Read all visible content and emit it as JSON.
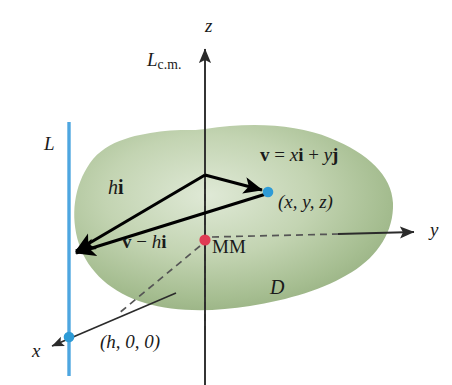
{
  "figure": {
    "background": "#ffffff",
    "width": 452,
    "height": 385
  },
  "colors": {
    "region_fill_light": "#d8e4cd",
    "region_fill_mid": "#a8bf94",
    "region_fill_edge": "#8aa877",
    "axis": "#2b2b2b",
    "vector": "#000000",
    "line_L": "#4ea6e0",
    "point_xyz": "#2e9bd6",
    "point_h00": "#2e9bd6",
    "point_cm": "#e03c54",
    "dashed": "#4a4a4a",
    "text": "#1a1a1a"
  },
  "labels": {
    "z_axis": "z",
    "y_axis": "y",
    "x_axis": "x",
    "line_cm": "L",
    "line_cm_subscript": "c.m.",
    "line_L": "L",
    "vector_hi_h": "h",
    "vector_hi_i": "i",
    "vector_v_minus_hi_v": "v",
    "vector_v_minus_hi_minus": "−",
    "vector_v_minus_hi_h": "h",
    "vector_v_minus_hi_i": "i",
    "vector_eq_v": "v",
    "vector_eq_equals": "=",
    "vector_eq_x": "x",
    "vector_eq_i": "i",
    "vector_eq_plus": "+",
    "vector_eq_y": "y",
    "vector_eq_j": "j",
    "point_xyz": "(x, y, z)",
    "center_of_mass": "MM",
    "region": "D",
    "point_h00": "(h, 0, 0)"
  },
  "geometry": {
    "line_L_x": 69,
    "line_L_top": 122,
    "line_L_bottom": 376,
    "z_axis_x": 205,
    "z_axis_top": 45,
    "z_axis_bottom": 385,
    "origin": {
      "x": 205,
      "y": 240
    },
    "point_xyz": {
      "x": 268,
      "y": 192
    },
    "point_h00": {
      "x": 69,
      "y": 337
    },
    "triangle_apex": {
      "x": 205,
      "y": 175
    },
    "arrow_foot_on_L": {
      "x": 69,
      "y": 255
    },
    "y_axis_arrow_tip": {
      "x": 418,
      "y": 232
    },
    "x_axis_arrow_tip": {
      "x": 48,
      "y": 348
    }
  },
  "elements": {
    "region_name": "solid-region-D",
    "vectors": [
      "h-i-vector",
      "v-minus-h-i-vector",
      "v-vector"
    ],
    "dashed_guides": [
      "z-axis-dashed-segment",
      "y-axis-dashed-segment",
      "x-axis-dashed-segment"
    ]
  }
}
